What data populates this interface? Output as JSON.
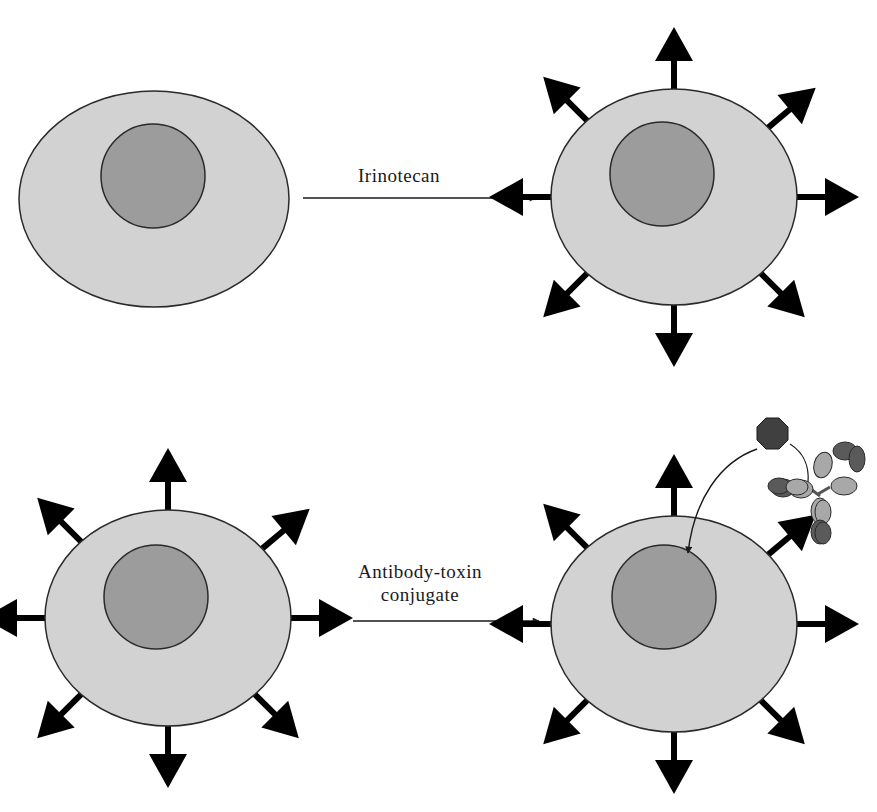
{
  "figure": {
    "colors": {
      "background": "#ffffff",
      "cytoplasm": "#d2d2d2",
      "nucleus": "#9c9c9c",
      "outline": "#2a2a2a",
      "receptor": "#000000",
      "toxin": "#404040",
      "antibody_light": "#a8a8a8",
      "antibody_dark": "#5a5a5a"
    },
    "panels": [
      {
        "id": "top",
        "before_cell": {
          "receptor_count": 0,
          "description": "cell without surface receptors"
        },
        "process_label_lines": [
          "Irinotecan"
        ],
        "after_cell": {
          "receptor_count": 8,
          "description": "cell with upregulated surface receptors"
        }
      },
      {
        "id": "bottom",
        "before_cell": {
          "receptor_count": 8,
          "description": "cell with surface receptors"
        },
        "process_label_lines": [
          "Antibody-toxin",
          "conjugate"
        ],
        "after_cell": {
          "receptor_count": 8,
          "description": "cell targeted by antibody-toxin conjugate; toxin delivered to nucleus"
        }
      }
    ],
    "conjugate": {
      "toxin_shape": "octagon",
      "antibody_shape": "Y-shaped immunoglobulin"
    }
  }
}
